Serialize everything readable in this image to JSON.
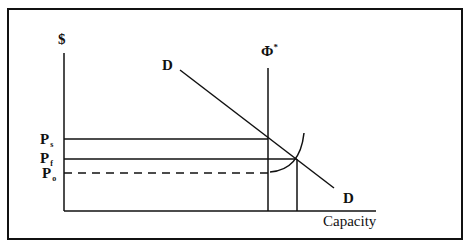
{
  "diagram": {
    "y_axis_label": "$",
    "x_axis_label": "Capacity",
    "capacity_label": "Φ",
    "capacity_superscript": "*",
    "demand_label_top": "D",
    "demand_label_bottom": "D",
    "price_labels": [
      {
        "main": "P",
        "sub": "s"
      },
      {
        "main": "P",
        "sub": "f"
      },
      {
        "main": "P",
        "sub": "o"
      }
    ],
    "colors": {
      "line": "#111111",
      "background": "#ffffff"
    }
  }
}
